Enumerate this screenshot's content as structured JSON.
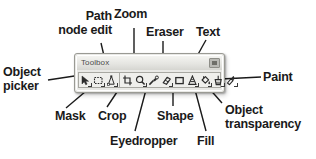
{
  "window": {
    "title": "Toolbox",
    "title_button": "menu-button"
  },
  "toolbar": {
    "tools": [
      {
        "name": "object-picker",
        "icon": "arrow-cursor",
        "has_submenu": true
      },
      {
        "name": "mask",
        "icon": "dashed-rectangle",
        "has_submenu": true
      },
      {
        "name": "path-node-edit",
        "icon": "node-edit-pen",
        "has_submenu": true
      },
      {
        "name": "crop",
        "icon": "crop-frame",
        "has_submenu": false
      },
      {
        "name": "zoom",
        "icon": "magnifier",
        "has_submenu": true
      },
      {
        "name": "eyedropper",
        "icon": "eyedropper-pipette",
        "has_submenu": false
      },
      {
        "name": "eraser",
        "icon": "eraser-block",
        "has_submenu": true
      },
      {
        "name": "shape",
        "icon": "rectangle-shape",
        "has_submenu": false
      },
      {
        "name": "text",
        "icon": "letter-a",
        "has_submenu": true
      },
      {
        "name": "fill",
        "icon": "paint-bucket",
        "has_submenu": true
      },
      {
        "name": "object-transparency",
        "icon": "transparency-glass",
        "has_submenu": true
      },
      {
        "name": "paint",
        "icon": "paint-brush",
        "has_submenu": true
      }
    ]
  },
  "annotations": {
    "path_node_edit": "Path\nnode edit",
    "zoom": "Zoom",
    "eraser": "Eraser",
    "text": "Text",
    "object_picker": "Object\npicker",
    "paint": "Paint",
    "mask": "Mask",
    "crop": "Crop",
    "shape": "Shape",
    "object_transparency": "Object\ntransparency",
    "eyedropper": "Eyedropper",
    "fill": "Fill"
  },
  "colors": {
    "text": "#1a1a1a",
    "leader_line": "#1a1a1a",
    "window_face": "#e9e9e6",
    "window_border": "#9a9a94",
    "titlebar": "#e4e4e0",
    "background": "#ffffff"
  }
}
